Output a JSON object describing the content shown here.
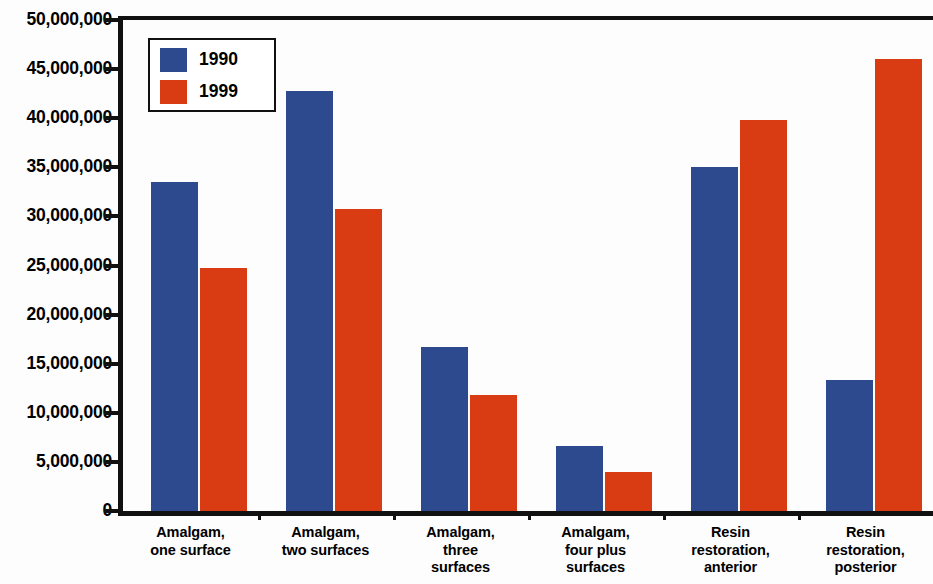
{
  "chart_data": {
    "type": "bar",
    "title": "",
    "subtitle": "",
    "xlabel": "",
    "ylabel": "",
    "grid": false,
    "legend_position": "inside-top-left",
    "ylim": [
      0,
      50000000
    ],
    "ytick_values": [
      0,
      5000000,
      10000000,
      15000000,
      20000000,
      25000000,
      30000000,
      35000000,
      40000000,
      45000000,
      50000000
    ],
    "ytick_labels": [
      "50,000,000",
      "45,000,000",
      "40,000,000",
      "35,000,000",
      "30,000,000",
      "25,000,000",
      "20,000,000",
      "15,000,000",
      "10,000,000",
      "5,000,000",
      "0"
    ],
    "categories": [
      "Amalgam, one surface",
      "Amalgam, two surfaces",
      "Amalgam, three surfaces",
      "Amalgam, four plus surfaces",
      "Resin restoration, anterior",
      "Resin restoration, posterior"
    ],
    "category_label_lines": [
      [
        "Amalgam,",
        "one surface"
      ],
      [
        "Amalgam,",
        "two surfaces"
      ],
      [
        "Amalgam,",
        "three",
        "surfaces"
      ],
      [
        "Amalgam,",
        "four plus",
        "surfaces"
      ],
      [
        "Resin",
        "restoration,",
        "anterior"
      ],
      [
        "Resin",
        "restoration,",
        "posterior"
      ]
    ],
    "series": [
      {
        "name": "1990",
        "color": "#2e4a8f",
        "values": [
          33500000,
          42800000,
          16700000,
          6600000,
          35000000,
          13300000
        ]
      },
      {
        "name": "1999",
        "color": "#d93b12",
        "values": [
          24700000,
          30800000,
          11800000,
          4000000,
          39800000,
          46000000
        ]
      }
    ]
  },
  "legend": {
    "entries": [
      {
        "label": "1990",
        "swatch": "legend-swatch-1990"
      },
      {
        "label": "1999",
        "swatch": "legend-swatch-1999"
      }
    ]
  },
  "colors": {
    "series_1990": "#2e4a8f",
    "series_1999": "#d93b12",
    "axis": "#111111",
    "background": "#fdfdfd",
    "text": "#000000"
  }
}
